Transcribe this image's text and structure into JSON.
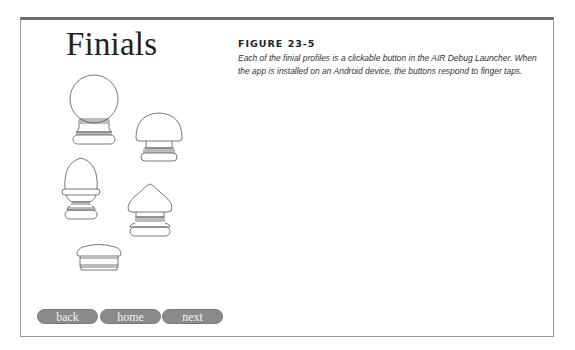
{
  "page": {
    "title": "Finials"
  },
  "figure": {
    "label": "FIGURE 23-5",
    "caption": "Each of the finial profiles is a clickable button in the AIR Debug Launcher. When the app is installed on an Android device, the buttons respond to finger taps."
  },
  "finials": [
    {
      "name": "ball-finial"
    },
    {
      "name": "mushroom-finial"
    },
    {
      "name": "acorn-finial"
    },
    {
      "name": "pointed-dome-finial"
    },
    {
      "name": "flat-cap-finial"
    }
  ],
  "nav": {
    "back_label": "back",
    "home_label": "home",
    "next_label": "next"
  }
}
